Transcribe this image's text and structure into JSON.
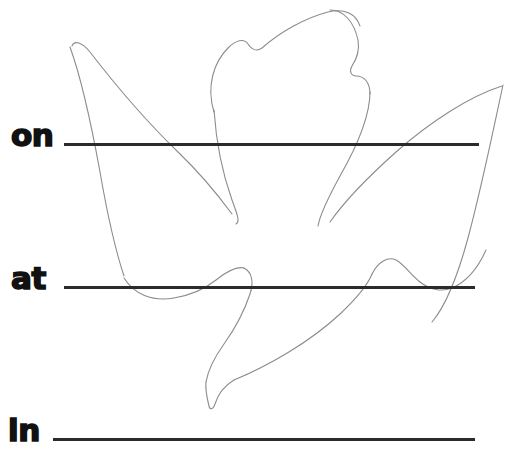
{
  "worksheet": {
    "background_color": "#ffffff",
    "label_color": "#111111",
    "line_color": "#2b2b2b",
    "artwork_stroke_color": "#8c8c8c",
    "artwork_name": "dove-outline",
    "rows": [
      {
        "label": "on",
        "line_name": "writing-line-on"
      },
      {
        "label": "at",
        "line_name": "writing-line-at"
      },
      {
        "label": "in",
        "line_name": "writing-line-in"
      }
    ]
  }
}
